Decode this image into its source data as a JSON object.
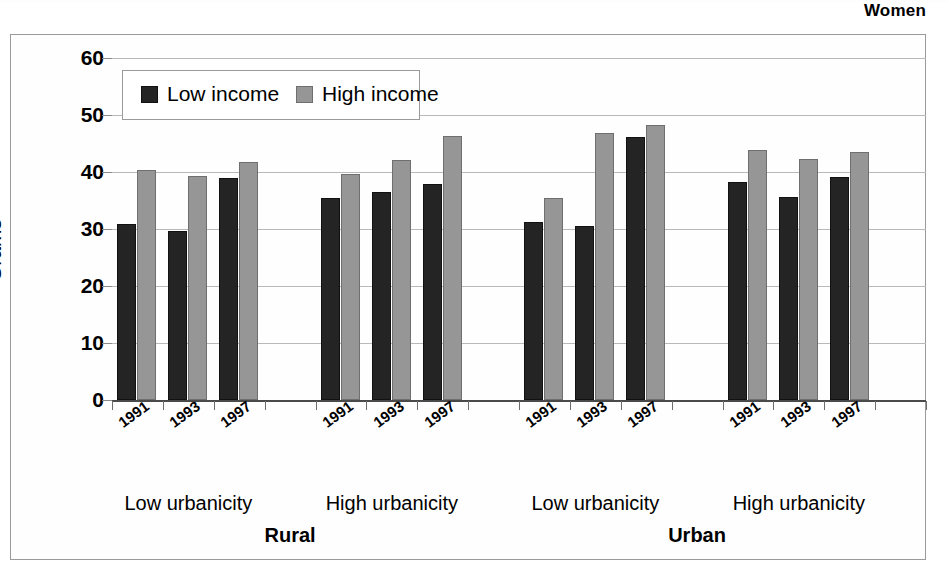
{
  "figure": {
    "title": "Women",
    "frame_border_color": "#9a9a9a"
  },
  "legend": {
    "entries": [
      {
        "label": "Low income",
        "color": "#242424",
        "key": "low"
      },
      {
        "label": "High income",
        "color": "#969696",
        "key": "high"
      }
    ]
  },
  "axis": {
    "y_title": "Grams",
    "y_ticks": [
      "0",
      "10",
      "20",
      "30",
      "40",
      "50",
      "60"
    ]
  },
  "panels": [
    {
      "label": "Rural",
      "groups": [
        "Low urbanicity",
        "High urbanicity"
      ]
    },
    {
      "label": "Urban",
      "groups": [
        "Low urbanicity",
        "High urbanicity"
      ]
    }
  ],
  "chart_data": {
    "type": "bar",
    "title": "Women",
    "xlabel": "",
    "ylabel": "Grams",
    "ylim": [
      0,
      60
    ],
    "ytick_values": [
      0,
      10,
      20,
      30,
      40,
      50,
      60
    ],
    "grid": true,
    "legend_position": "inside-top-left",
    "x_group_levels": [
      "Rural / Low urbanicity",
      "Rural / High urbanicity",
      "Urban / Low urbanicity",
      "Urban / High urbanicity"
    ],
    "categories": [
      "1991",
      "1993",
      "1997",
      "1991",
      "1993",
      "1997",
      "1991",
      "1993",
      "1997",
      "1991",
      "1993",
      "1997"
    ],
    "series": [
      {
        "name": "Low income",
        "color": "#242424",
        "values": [
          30.8,
          29.6,
          39.0,
          35.4,
          36.5,
          37.9,
          31.2,
          30.5,
          46.1,
          38.2,
          35.7,
          39.1
        ]
      },
      {
        "name": "High income",
        "color": "#969696",
        "values": [
          40.4,
          39.3,
          41.7,
          39.7,
          42.1,
          46.3,
          35.4,
          46.9,
          48.3,
          43.9,
          42.2,
          43.5
        ]
      }
    ]
  }
}
